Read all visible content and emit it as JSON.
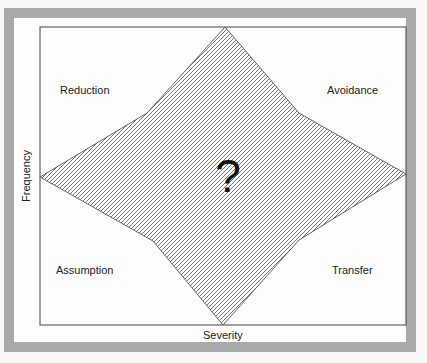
{
  "diagram": {
    "type": "risk-management-matrix",
    "quadrants": {
      "top_left": "Reduction",
      "top_right": "Avoidance",
      "bottom_left": "Assumption",
      "bottom_right": "Transfer"
    },
    "center_symbol": "?",
    "x_axis_label": "Severity",
    "y_axis_label": "Frequency",
    "colors": {
      "frame": "#a9a9a9",
      "background": "#fdfdfd",
      "hatch": "#555555",
      "outline": "#444444"
    }
  }
}
